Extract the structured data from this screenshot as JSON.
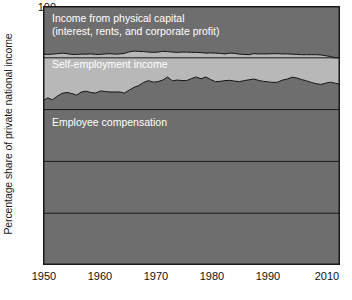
{
  "chart_data": {
    "type": "area",
    "subtype": "stacked-area-100",
    "title": "",
    "subtitle": "",
    "xlabel": "",
    "ylabel": "Percentage share of private national income",
    "xlim": [
      1948,
      2010
    ],
    "ylim": [
      0,
      100
    ],
    "grid": true,
    "grid_axis": "y",
    "legend_position": "inline-annotations",
    "x_ticks": [
      1950,
      1960,
      1970,
      1980,
      1990,
      2010
    ],
    "x_tick_labels": [
      "1950",
      "1960",
      "1970",
      "1980",
      "1990",
      "2010"
    ],
    "y_ticks": [
      20,
      40,
      60,
      80,
      100
    ],
    "y_tick_labels": [
      "20",
      "40",
      "60",
      "80",
      "100"
    ],
    "colors": {
      "employee_compensation": "#6e6e6e",
      "self_employment_income": "#b8b8b8",
      "income_from_physical_capital": "#6e6e6e",
      "plot_border": "#1a1a1a",
      "gridline": "#1a1a1a",
      "boundary_line": "#111111",
      "label_text_light": "#ffffff",
      "axis_text": "#111111",
      "background": "#ffffff"
    },
    "series": [
      {
        "name": "Employee compensation",
        "label": "Employee compensation",
        "stack_order": 1,
        "color": "#6e6e6e",
        "x": [
          1948,
          1949,
          1950,
          1951,
          1952,
          1953,
          1954,
          1955,
          1956,
          1957,
          1958,
          1959,
          1960,
          1961,
          1962,
          1963,
          1964,
          1965,
          1966,
          1967,
          1968,
          1969,
          1970,
          1971,
          1972,
          1973,
          1974,
          1975,
          1976,
          1977,
          1978,
          1979,
          1980,
          1981,
          1982,
          1983,
          1984,
          1985,
          1986,
          1987,
          1988,
          1989,
          1990,
          1991,
          1992,
          1993,
          1994,
          1995,
          1996,
          1997,
          1998,
          1999,
          2000,
          2001,
          2002,
          2003,
          2004,
          2005,
          2006,
          2007,
          2008,
          2009,
          2010
        ],
        "values": [
          63.5,
          64.5,
          63.8,
          65.2,
          66.3,
          66.6,
          66.2,
          65.6,
          66.8,
          67.1,
          66.6,
          66.4,
          67.2,
          67.0,
          66.8,
          66.8,
          66.8,
          66.4,
          67.5,
          68.6,
          69.3,
          70.5,
          71.2,
          70.6,
          70.8,
          71.4,
          72.6,
          71.1,
          71.4,
          71.2,
          71.2,
          72.0,
          72.6,
          71.9,
          72.6,
          71.6,
          70.8,
          70.9,
          71.2,
          71.3,
          71.0,
          70.8,
          71.2,
          71.5,
          71.8,
          71.3,
          70.9,
          70.7,
          70.5,
          70.6,
          71.4,
          71.8,
          72.5,
          72.2,
          71.6,
          71.1,
          70.5,
          70.0,
          69.7,
          70.2,
          70.6,
          70.2,
          69.8
        ]
      },
      {
        "name": "Self-employment income",
        "label": "Self-employment income",
        "stack_order": 2,
        "color": "#b8b8b8",
        "x": [
          1948,
          1949,
          1950,
          1951,
          1952,
          1953,
          1954,
          1955,
          1956,
          1957,
          1958,
          1959,
          1960,
          1961,
          1962,
          1963,
          1964,
          1965,
          1966,
          1967,
          1968,
          1969,
          1970,
          1971,
          1972,
          1973,
          1974,
          1975,
          1976,
          1977,
          1978,
          1979,
          1980,
          1981,
          1982,
          1983,
          1984,
          1985,
          1986,
          1987,
          1988,
          1989,
          1990,
          1991,
          1992,
          1993,
          1994,
          1995,
          1996,
          1997,
          1998,
          1999,
          2000,
          2001,
          2002,
          2003,
          2004,
          2005,
          2006,
          2007,
          2008,
          2009,
          2010
        ],
        "values": [
          17.9,
          16.8,
          17.6,
          16.4,
          15.5,
          15.0,
          15.1,
          15.7,
          14.6,
          14.3,
          14.9,
          14.9,
          14.1,
          14.5,
          14.8,
          14.6,
          14.7,
          15.3,
          14.8,
          14.0,
          13.2,
          11.9,
          11.0,
          11.5,
          11.4,
          11.1,
          9.8,
          11.1,
          10.7,
          11.0,
          11.0,
          10.1,
          9.5,
          10.1,
          9.2,
          10.3,
          11.0,
          10.8,
          10.3,
          10.5,
          10.7,
          10.6,
          10.1,
          9.7,
          9.8,
          10.2,
          10.6,
          10.8,
          11.1,
          11.0,
          10.1,
          9.7,
          8.9,
          9.1,
          9.6,
          10.1,
          10.7,
          11.2,
          11.4,
          10.6,
          9.9,
          9.8,
          10.2
        ]
      },
      {
        "name": "Income from physical capital (interest, rents, and corporate profit)",
        "label": "Income from physical capital",
        "label_line2": "(interest, rents, and corporate profit)",
        "stack_order": 3,
        "color": "#6e6e6e",
        "x": [
          1948,
          1949,
          1950,
          1951,
          1952,
          1953,
          1954,
          1955,
          1956,
          1957,
          1958,
          1959,
          1960,
          1961,
          1962,
          1963,
          1964,
          1965,
          1966,
          1967,
          1968,
          1969,
          1970,
          1971,
          1972,
          1973,
          1974,
          1975,
          1976,
          1977,
          1978,
          1979,
          1980,
          1981,
          1982,
          1983,
          1984,
          1985,
          1986,
          1987,
          1988,
          1989,
          1990,
          1991,
          1992,
          1993,
          1994,
          1995,
          1996,
          1997,
          1998,
          1999,
          2000,
          2001,
          2002,
          2003,
          2004,
          2005,
          2006,
          2007,
          2008,
          2009,
          2010
        ],
        "values": [
          18.6,
          18.7,
          18.6,
          18.4,
          18.2,
          18.4,
          18.7,
          18.7,
          18.6,
          18.6,
          18.5,
          18.7,
          18.7,
          18.5,
          18.4,
          18.6,
          18.5,
          18.3,
          17.7,
          17.4,
          17.5,
          17.6,
          17.8,
          17.9,
          17.8,
          17.5,
          17.6,
          17.8,
          17.9,
          17.8,
          17.8,
          17.9,
          17.9,
          18.0,
          18.2,
          18.1,
          18.2,
          18.3,
          18.5,
          18.2,
          18.3,
          18.6,
          18.7,
          18.8,
          18.4,
          18.5,
          18.5,
          18.5,
          18.4,
          18.4,
          18.5,
          18.5,
          18.6,
          18.7,
          18.8,
          18.8,
          18.8,
          18.8,
          18.9,
          19.2,
          19.5,
          20.0,
          20.0
        ]
      }
    ]
  },
  "axes": {
    "y_title": "Percentage share of private national income",
    "y_tick_labels": [
      "100",
      "80",
      "60",
      "40",
      "20"
    ],
    "x_tick_labels": [
      "1950",
      "1960",
      "1970",
      "1980",
      "1990",
      "2010"
    ]
  },
  "annotations": {
    "capital_line1": "Income from physical capital",
    "capital_line2": "(interest, rents, and corporate profit)",
    "self_employment": "Self-employment income",
    "employee": "Employee compensation"
  }
}
